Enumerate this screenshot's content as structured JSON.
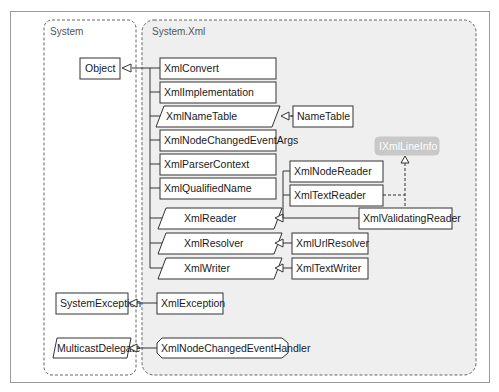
{
  "namespaces": {
    "system": {
      "label": "System"
    },
    "system_xml": {
      "label": "System.Xml"
    }
  },
  "system_types": {
    "object": "Object",
    "system_exception": "SystemException",
    "multicast_delegate": "MulticastDelegate"
  },
  "xml_types": {
    "xml_convert": "XmlConvert",
    "xml_implementation": "XmlImplementation",
    "xml_name_table": "XmlNameTable",
    "xml_node_changed_event_args": "XmlNodeChangedEventArgs",
    "xml_parser_context": "XmlParserContext",
    "xml_qualified_name": "XmlQualifiedName",
    "xml_reader": "XmlReader",
    "xml_resolver": "XmlResolver",
    "xml_writer": "XmlWriter",
    "name_table": "NameTable",
    "xml_node_reader": "XmlNodeReader",
    "xml_text_reader": "XmlTextReader",
    "xml_validating_reader": "XmlValidatingReader",
    "xml_url_resolver": "XmlUrlResolver",
    "xml_text_writer": "XmlTextWriter",
    "xml_exception": "XmlException",
    "xml_node_changed_event_handler": "XmlNodeChangedEventHandler",
    "ixml_line_info": "IXmlLineInfo"
  },
  "legend_notes": {
    "abstract_shape": "parallelogram",
    "delegate_shape": "octagon",
    "interface_shape": "rounded-gray"
  },
  "colors": {
    "system_xml_bg": "#efefef",
    "interface_fill": "#c8c8c8",
    "interface_text": "#ffffff",
    "line": "#333333"
  }
}
